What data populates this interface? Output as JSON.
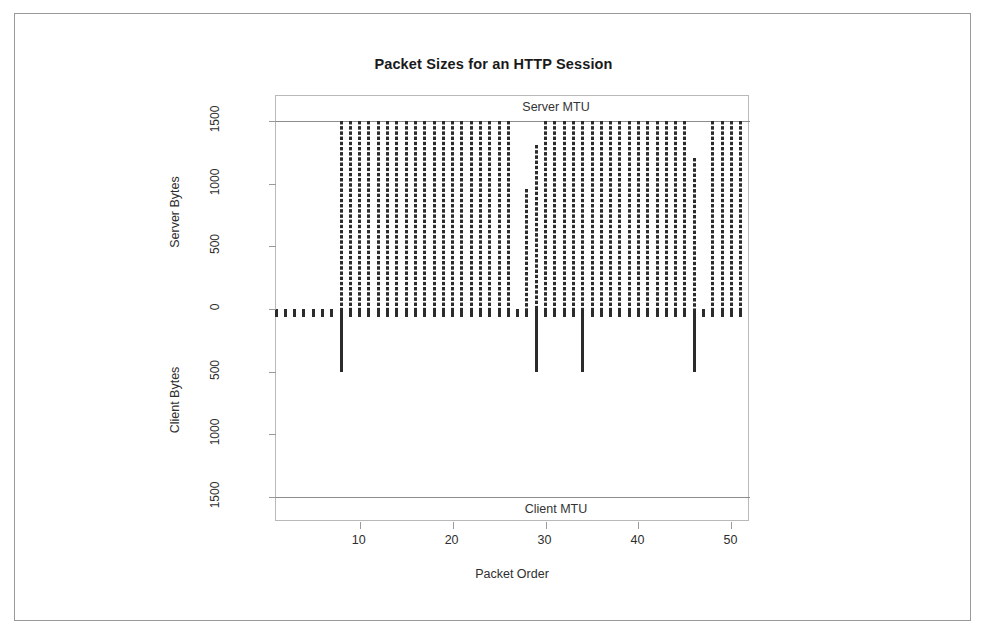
{
  "figure": {
    "background_color": "#ffffff",
    "border_color": "#999999",
    "bar_color": "#2b2b2b",
    "axis_color": "#9a9a9a"
  },
  "chart_data": {
    "type": "bar",
    "title": "Packet Sizes for an HTTP Session",
    "xlabel": "Packet Order",
    "ylabel_top": "Server Bytes",
    "ylabel_bottom": "Client Bytes",
    "grid": false,
    "legend": "none",
    "xlim": [
      1,
      52
    ],
    "ylim": [
      -1700,
      1700
    ],
    "xticks": [
      10,
      20,
      30,
      40,
      50
    ],
    "xtick_labels": [
      "10",
      "20",
      "30",
      "40",
      "50"
    ],
    "yticks": [
      1500,
      1000,
      500,
      0,
      -500,
      -1000,
      -1500
    ],
    "ytick_labels": [
      "1500",
      "1000",
      "500",
      "0",
      "500",
      "1000",
      "1500"
    ],
    "annotations": [
      {
        "text": "Server MTU",
        "y": 1500,
        "position": "above-line"
      },
      {
        "text": "Client MTU",
        "y": -1500,
        "position": "below-line"
      }
    ],
    "reference_lines": [
      {
        "label": "Server MTU",
        "value": 1500
      },
      {
        "label": "Client MTU",
        "value": -1500
      }
    ],
    "x": [
      1,
      2,
      3,
      4,
      5,
      6,
      7,
      8,
      9,
      10,
      11,
      12,
      13,
      14,
      15,
      16,
      17,
      18,
      19,
      20,
      21,
      22,
      23,
      24,
      25,
      26,
      27,
      28,
      29,
      30,
      31,
      32,
      33,
      34,
      35,
      36,
      37,
      38,
      39,
      40,
      41,
      42,
      43,
      44,
      45,
      46,
      47,
      48,
      49,
      50,
      51
    ],
    "series": [
      {
        "name": "Server Bytes",
        "values": [
          0,
          0,
          0,
          0,
          0,
          0,
          0,
          1500,
          1500,
          1500,
          1500,
          1500,
          1500,
          1500,
          1500,
          1500,
          1500,
          1500,
          1500,
          1500,
          1500,
          1500,
          1500,
          1500,
          1500,
          1500,
          0,
          960,
          1310,
          1500,
          1500,
          1500,
          1500,
          1500,
          1500,
          1500,
          1500,
          1500,
          1500,
          1500,
          1500,
          1500,
          1500,
          1500,
          1500,
          1205,
          0,
          1500,
          1500,
          1500,
          1500
        ]
      },
      {
        "name": "Client Bytes",
        "values": [
          -60,
          -60,
          -60,
          -60,
          -60,
          -60,
          -60,
          -500,
          -60,
          -60,
          -60,
          -60,
          -60,
          -60,
          -60,
          -60,
          -60,
          -60,
          -60,
          -60,
          -60,
          -60,
          -60,
          -60,
          -60,
          -60,
          -60,
          -60,
          -500,
          -60,
          -60,
          -60,
          -60,
          -500,
          -60,
          -60,
          -60,
          -60,
          -60,
          -60,
          -60,
          -60,
          -60,
          -60,
          -60,
          -500,
          -60,
          -60,
          -60,
          -60,
          -60
        ]
      }
    ]
  }
}
